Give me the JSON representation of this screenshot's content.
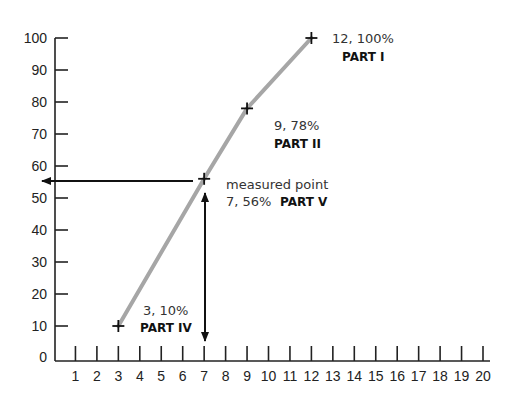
{
  "chart_data": {
    "type": "line",
    "title": "",
    "xlabel": "",
    "ylabel": "",
    "xlim": [
      0,
      20
    ],
    "ylim": [
      0,
      100
    ],
    "x_ticks": [
      1,
      2,
      3,
      4,
      5,
      6,
      7,
      8,
      9,
      10,
      11,
      12,
      13,
      14,
      15,
      16,
      17,
      18,
      19,
      20
    ],
    "y_ticks": [
      0,
      10,
      20,
      30,
      40,
      50,
      60,
      70,
      80,
      90,
      100
    ],
    "grid": false,
    "legend": null,
    "series": [
      {
        "name": "curve",
        "color": "#a6a6a6",
        "points": [
          {
            "x": 3,
            "y": 10,
            "label": "3, 10%",
            "part": "PART IV"
          },
          {
            "x": 7,
            "y": 56,
            "label": "7, 56%",
            "part": "PART V",
            "note": "measured point"
          },
          {
            "x": 9,
            "y": 78,
            "label": "9, 78%",
            "part": "PART II"
          },
          {
            "x": 12,
            "y": 100,
            "label": "12, 100%",
            "part": "PART I"
          }
        ]
      }
    ],
    "annotations": [
      {
        "type": "arrow",
        "from": [
          7,
          56
        ],
        "to": [
          0,
          56
        ],
        "direction": "left"
      },
      {
        "type": "arrow",
        "from": [
          7,
          56
        ],
        "to": [
          7,
          0
        ],
        "direction": "double-vertical"
      }
    ]
  },
  "labels": {
    "p1_value": "12, 100%",
    "p1_part": "PART I",
    "p2_value": "9, 78%",
    "p2_part": "PART II",
    "p5_note": "measured point",
    "p5_value": "7, 56%",
    "p5_part": "PART V",
    "p4_value": "3, 10%",
    "p4_part": "PART IV"
  },
  "y_labels": [
    "100",
    "90",
    "80",
    "70",
    "60",
    "50",
    "40",
    "30",
    "20",
    "10",
    "0"
  ],
  "x_labels": [
    "1",
    "2",
    "3",
    "4",
    "5",
    "6",
    "7",
    "8",
    "9",
    "10",
    "11",
    "12",
    "13",
    "14",
    "15",
    "16",
    "17",
    "18",
    "19",
    "20"
  ]
}
